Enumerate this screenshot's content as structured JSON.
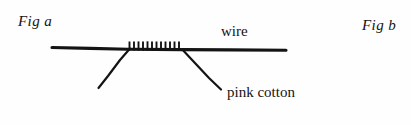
{
  "figure": {
    "background_color": "#fefefe",
    "ink_color": "#141414",
    "captions": {
      "fig_a": "Fig a",
      "fig_b": "Fig b"
    },
    "labels": {
      "wire": "wire",
      "pink_cotton": "pink cotton"
    },
    "geometry": {
      "wire_left_x": 52,
      "wire_right_x": 286,
      "wire_y": 49,
      "wire_thickness": 3,
      "coil_start_x": 128,
      "coil_end_x": 182,
      "coil_turns": 12,
      "coil_turn_height": 9,
      "cotton_left_leg": "130,48 98,88",
      "cotton_right_leg": "183,50 221,89"
    }
  }
}
